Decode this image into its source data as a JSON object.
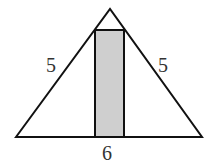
{
  "diagram": {
    "type": "isosceles triangle with inscribed rectangle",
    "labels": {
      "left_side": "5",
      "right_side": "5",
      "base": "6"
    },
    "colors": {
      "stroke": "#111111",
      "rectangle_fill": "#cfcfcf",
      "label": "#333333"
    }
  }
}
